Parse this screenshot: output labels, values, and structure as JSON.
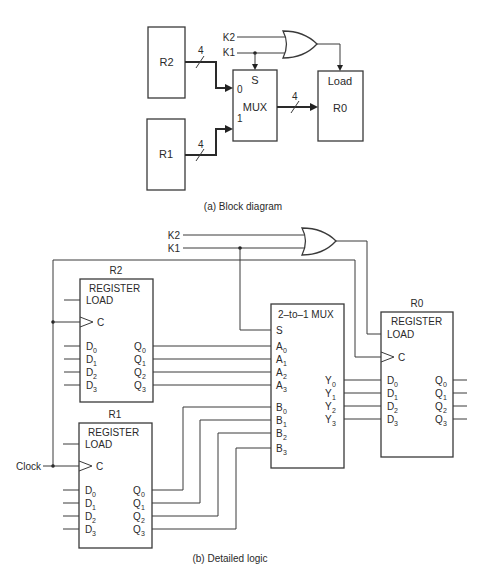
{
  "block_diagram": {
    "caption": "(a) Block diagram",
    "registers": {
      "r2": "R2",
      "r1": "R1",
      "r0": "R0"
    },
    "r0_load_label": "Load",
    "mux": {
      "label": "MUX",
      "select_label": "S",
      "input0": "0",
      "input1": "1"
    },
    "bus_width": "4",
    "signals": {
      "k2": "K2",
      "k1": "K1"
    }
  },
  "detailed_logic": {
    "caption": "(b) Detailed logic",
    "signals": {
      "k2": "K2",
      "k1": "K1",
      "clock": "Clock"
    },
    "registers": [
      {
        "name": "R2",
        "type": "REGISTER",
        "load": "LOAD",
        "clock": "C",
        "inputs": [
          "D",
          "D",
          "D",
          "D"
        ],
        "outputs": [
          "Q",
          "Q",
          "Q",
          "Q"
        ],
        "idx": [
          "0",
          "1",
          "2",
          "3"
        ]
      },
      {
        "name": "R1",
        "type": "REGISTER",
        "load": "LOAD",
        "clock": "C",
        "inputs": [
          "D",
          "D",
          "D",
          "D"
        ],
        "outputs": [
          "Q",
          "Q",
          "Q",
          "Q"
        ],
        "idx": [
          "0",
          "1",
          "2",
          "3"
        ]
      },
      {
        "name": "R0",
        "type": "REGISTER",
        "load": "LOAD",
        "clock": "C",
        "inputs": [
          "D",
          "D",
          "D",
          "D"
        ],
        "outputs": [
          "Q",
          "Q",
          "Q",
          "Q"
        ],
        "idx": [
          "0",
          "1",
          "2",
          "3"
        ]
      }
    ],
    "mux": {
      "title": "2–to–1 MUX",
      "select": "S",
      "a_inputs": [
        "A",
        "A",
        "A",
        "A"
      ],
      "b_inputs": [
        "B",
        "B",
        "B",
        "B"
      ],
      "outputs": [
        "Y",
        "Y",
        "Y",
        "Y"
      ],
      "idx": [
        "0",
        "1",
        "2",
        "3"
      ]
    }
  }
}
